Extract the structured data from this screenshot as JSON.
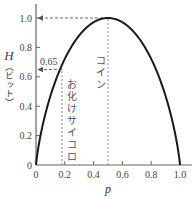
{
  "chart_data": {
    "type": "line",
    "title": "",
    "xlabel": "p",
    "ylabel": "H（ビット）",
    "ylabel_symbol": "H",
    "ylabel_unit": "（ビット）",
    "xlim": [
      0,
      1.0
    ],
    "ylim": [
      0,
      1.0
    ],
    "x_ticks": [
      "0",
      "0.2",
      "0.4",
      "0.6",
      "0.8",
      "1.0"
    ],
    "y_ticks": [
      "0",
      "0.2",
      "0.4",
      "0.6",
      "0.8",
      "1.0"
    ],
    "grid": false,
    "series": [
      {
        "name": "Binary entropy H(p)",
        "x": [
          0,
          0.05,
          0.1,
          0.15,
          0.2,
          0.25,
          0.3,
          0.35,
          0.4,
          0.45,
          0.5,
          0.55,
          0.6,
          0.65,
          0.7,
          0.75,
          0.8,
          0.85,
          0.9,
          0.95,
          1.0
        ],
        "y": [
          0,
          0.286,
          0.469,
          0.61,
          0.722,
          0.811,
          0.881,
          0.934,
          0.971,
          0.993,
          1.0,
          0.993,
          0.971,
          0.934,
          0.881,
          0.811,
          0.722,
          0.61,
          0.469,
          0.286,
          0
        ]
      }
    ],
    "annotations": [
      {
        "type": "vline",
        "x": 0.18,
        "label": "お化けサイコロ",
        "style": "dashed"
      },
      {
        "type": "hline",
        "y": 0.65,
        "label": "0.65",
        "style": "dashed-arrow"
      },
      {
        "type": "vline",
        "x": 0.5,
        "label": "コイン",
        "style": "dashed"
      },
      {
        "type": "hline",
        "y": 1.0,
        "label": "1.0",
        "style": "dashed-arrow"
      }
    ]
  }
}
